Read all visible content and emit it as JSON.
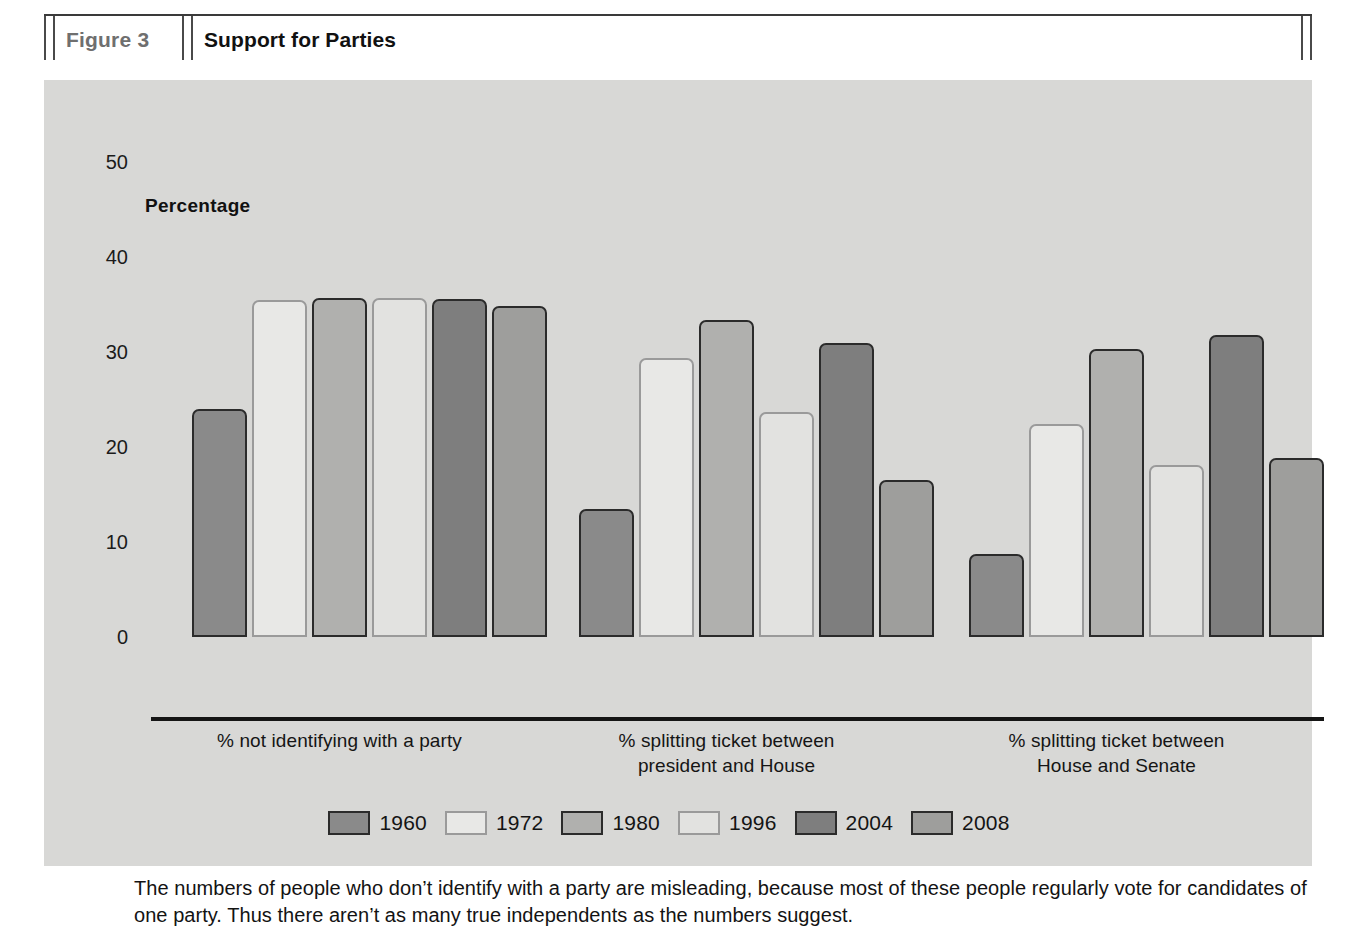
{
  "header": {
    "figure_number": "Figure 3",
    "title": "Support for Parties"
  },
  "chart_data": {
    "type": "bar",
    "title": "Support for Parties",
    "ylabel": "Percentage",
    "xlabel": "",
    "ylim": [
      0,
      50
    ],
    "yticks": [
      "0",
      "10",
      "20",
      "30",
      "40",
      "50"
    ],
    "grid": false,
    "legend_position": "bottom",
    "categories": [
      "% not identifying with a party",
      "% splitting ticket between president and House",
      "% splitting ticket between House and Senate"
    ],
    "category_lines": [
      [
        "% not identifying with a party"
      ],
      [
        "% splitting ticket between",
        "president and House"
      ],
      [
        "% splitting ticket between",
        "House and Senate"
      ]
    ],
    "series": [
      {
        "name": "1960",
        "color": "#8a8a8a",
        "values": [
          24.0,
          13.5,
          8.7
        ]
      },
      {
        "name": "1972",
        "color": "#e8e8e6",
        "values": [
          35.5,
          29.4,
          22.4
        ]
      },
      {
        "name": "1980",
        "color": "#b0b0ae",
        "values": [
          35.7,
          33.4,
          30.3
        ]
      },
      {
        "name": "1996",
        "color": "#e2e2e0",
        "values": [
          35.7,
          23.7,
          18.1
        ]
      },
      {
        "name": "2004",
        "color": "#7e7e7e",
        "values": [
          35.6,
          31.0,
          31.8
        ]
      },
      {
        "name": "2008",
        "color": "#9e9e9c",
        "values": [
          34.8,
          16.5,
          18.8
        ]
      }
    ]
  },
  "caption": {
    "text": "The numbers of people who don’t identify with a party are misleading, because most of these people regularly vote for candidates of one party. Thus there aren’t as many true independents as the numbers suggest."
  },
  "colors": {
    "panel_background": "#d8d8d6",
    "page_background": "#ffffff",
    "axis": "#151515",
    "figure_number": "#6f6f6f"
  }
}
